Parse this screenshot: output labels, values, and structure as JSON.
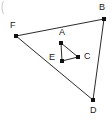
{
  "figure": {
    "background_color": "#ffffff",
    "line_color": "#2b2b2b",
    "dot_color": "#111111",
    "label_color": "#1a1a1a",
    "width": 112,
    "height": 120,
    "corner_mark": {
      "name": "top-left-arc-fragment",
      "color": "#c9c9c9"
    },
    "vertices": [
      {
        "id": "A",
        "label": "A",
        "x": 61,
        "y": 43,
        "label_x": 59,
        "label_y": 28,
        "group": "inner"
      },
      {
        "id": "B",
        "label": "B",
        "x": 104,
        "y": 19,
        "label_x": 99,
        "label_y": 3,
        "group": "outer"
      },
      {
        "id": "C",
        "label": "C",
        "x": 78,
        "y": 57,
        "label_x": 84,
        "label_y": 52,
        "group": "inner"
      },
      {
        "id": "D",
        "label": "D",
        "x": 93,
        "y": 100,
        "label_x": 90,
        "label_y": 106,
        "group": "outer"
      },
      {
        "id": "E",
        "label": "E",
        "x": 62,
        "y": 61,
        "label_x": 49,
        "label_y": 53,
        "group": "inner"
      },
      {
        "id": "F",
        "label": "F",
        "x": 16,
        "y": 36,
        "label_x": 10,
        "label_y": 21,
        "group": "outer"
      }
    ],
    "edges": [
      {
        "name": "edge-F-B",
        "from": "F",
        "to": "B",
        "group": "outer"
      },
      {
        "name": "edge-B-D",
        "from": "B",
        "to": "D",
        "group": "outer"
      },
      {
        "name": "edge-D-F",
        "from": "D",
        "to": "F",
        "group": "outer"
      },
      {
        "name": "edge-A-E",
        "from": "A",
        "to": "E",
        "group": "inner"
      },
      {
        "name": "edge-E-C",
        "from": "E",
        "to": "C",
        "group": "inner"
      },
      {
        "name": "edge-C-A",
        "from": "C",
        "to": "A",
        "group": "inner"
      }
    ]
  }
}
